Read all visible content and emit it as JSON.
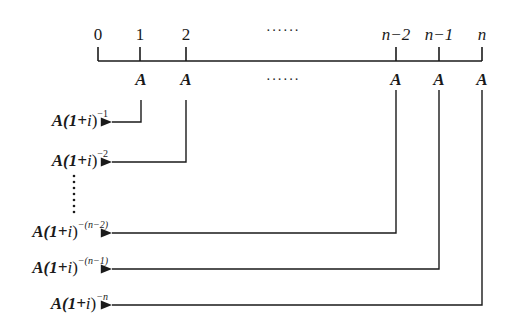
{
  "diagram": {
    "type": "annuity-present-value-timeline",
    "timeline": {
      "periods": [
        {
          "label": "0",
          "italic": false
        },
        {
          "label": "1",
          "italic": false
        },
        {
          "label": "2",
          "italic": false
        },
        {
          "label": "n−2",
          "italic": true
        },
        {
          "label": "n−1",
          "italic": true
        },
        {
          "label": "n",
          "italic": true
        }
      ],
      "ellipsis": "······",
      "payments": [
        "A",
        "A",
        "A",
        "A",
        "A"
      ],
      "payment_ellipsis": "······"
    },
    "present_values": [
      {
        "base": "A(1+",
        "var": "i",
        "close": ")",
        "exponent": "−1",
        "from_period": "1"
      },
      {
        "base": "A(1+",
        "var": "i",
        "close": ")",
        "exponent": "−2",
        "from_period": "2"
      },
      {
        "base": "A(1+",
        "var": "i",
        "close": ")",
        "exponent": "−(n−2)",
        "from_period": "n−2"
      },
      {
        "base": "A(1+",
        "var": "i",
        "close": ")",
        "exponent": "−(n−1)",
        "from_period": "n−1"
      },
      {
        "base": "A(1+",
        "var": "i",
        "close": ")",
        "exponent": "−n",
        "from_period": "n"
      }
    ],
    "vertical_ellipsis": "⋮",
    "colors": {
      "line": "#1a1a1a",
      "background": "#ffffff"
    }
  }
}
